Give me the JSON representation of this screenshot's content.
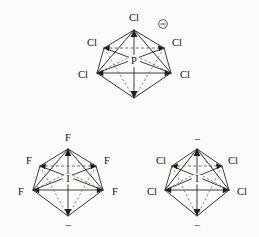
{
  "figure": {
    "name": "octahedral-complex-ions",
    "background_color": "#fbfbfa",
    "line_color": "#1c1c1c",
    "dashed_line_color": "#4a4a4a"
  },
  "structures": [
    {
      "id": "pcl6-anion",
      "center_atom": "P",
      "charge_symbol": "⊖",
      "charge_type": "circled-minus",
      "geometry": "octahedral",
      "vertex_labels": {
        "apex_top": "Cl",
        "equatorial_back_left": "Cl",
        "equatorial_back_right": "Cl",
        "equatorial_front_left": "Cl",
        "equatorial_front_right": "Cl",
        "apex_bottom": ""
      }
    },
    {
      "id": "if6-anion",
      "center_atom": "I",
      "charge_symbol": "−",
      "charge_type": "plain-minus-below",
      "geometry": "octahedral",
      "vertex_labels": {
        "apex_top": "F",
        "equatorial_back_left": "F",
        "equatorial_back_right": "F",
        "equatorial_front_left": "F",
        "equatorial_front_right": "F",
        "apex_bottom": ""
      }
    },
    {
      "id": "icl6-anion",
      "center_atom": "I",
      "charge_symbol": "−",
      "charge_type": "plain-minus-above-and-below",
      "geometry": "octahedral",
      "vertex_labels": {
        "apex_top": "",
        "equatorial_back_left": "Cl",
        "equatorial_back_right": "Cl",
        "equatorial_front_left": "Cl",
        "equatorial_front_right": "Cl",
        "apex_bottom": ""
      }
    }
  ]
}
